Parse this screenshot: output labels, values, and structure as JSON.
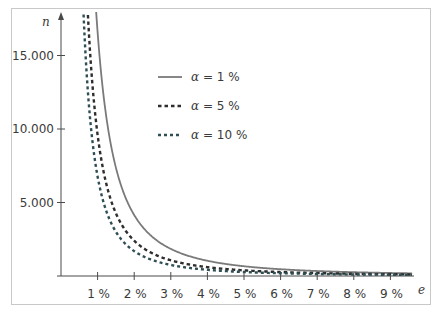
{
  "chart_data": {
    "type": "line",
    "title": "",
    "xlabel": "e",
    "ylabel": "n",
    "x_ticks": [
      "1 %",
      "2 %",
      "3 %",
      "4 %",
      "5 %",
      "6 %",
      "7 %",
      "8 %",
      "9 %"
    ],
    "y_ticks": [
      "5.000",
      "10.000",
      "15.000"
    ],
    "y_tick_values": [
      5000,
      10000,
      15000
    ],
    "xlim": [
      0,
      9.6
    ],
    "ylim": [
      0,
      17800
    ],
    "grid": false,
    "legend_position": "upper center",
    "x": [
      1,
      2,
      3,
      4,
      5,
      6,
      7,
      8,
      9
    ],
    "series": [
      {
        "name": "α = 1 %",
        "label_alpha": "α",
        "label_rest": " = 1 %",
        "style": "solid",
        "color": "#7a7a7a",
        "k": 16587,
        "values": [
          16587,
          4147,
          1843,
          1037,
          663,
          461,
          339,
          259,
          205
        ]
      },
      {
        "name": "α = 5 %",
        "label_alpha": "α",
        "label_rest": " = 5 %",
        "style": "dashed",
        "color": "#2e2e2e",
        "k": 9604,
        "values": [
          9604,
          2401,
          1067,
          600,
          384,
          267,
          196,
          150,
          119
        ]
      },
      {
        "name": "α = 10 %",
        "label_alpha": "α",
        "label_rest": " = 10 %",
        "style": "dashed",
        "color": "#2f4f55",
        "k": 6765,
        "values": [
          6765,
          1691,
          752,
          423,
          271,
          188,
          138,
          106,
          84
        ]
      }
    ]
  }
}
